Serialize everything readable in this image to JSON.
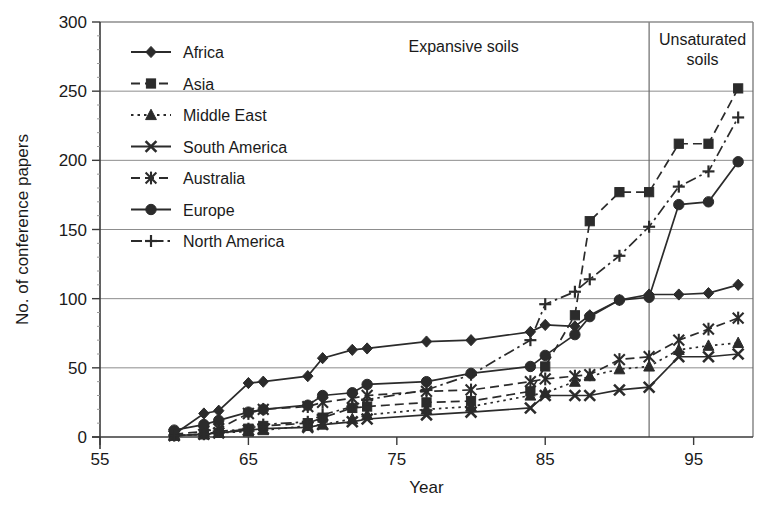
{
  "figure": {
    "background": "#ffffff",
    "ink_color": "#2b2b2b",
    "grid_color": "#8d8d8d"
  },
  "chart_data": {
    "type": "line",
    "title": "",
    "xlabel": "Year",
    "ylabel": "No. of conference papers",
    "xlim": [
      55,
      99
    ],
    "ylim": [
      0,
      300
    ],
    "xticks": [
      55,
      65,
      75,
      85,
      95
    ],
    "yticks": [
      0,
      50,
      100,
      150,
      200,
      250,
      300
    ],
    "grid": "horizontal",
    "legend_position": "top-left",
    "annotations": [
      {
        "text": "Expansive soils",
        "x": 79.5,
        "y": 288
      },
      {
        "text": "Unsaturated soils",
        "x": 94.5,
        "y": 288
      }
    ],
    "dividers": [
      {
        "x": 92
      }
    ],
    "series": [
      {
        "name": "Africa",
        "marker": "diamond",
        "dash": "solid",
        "x": [
          60,
          62,
          63,
          65,
          66,
          69,
          70,
          72,
          73,
          77,
          80,
          84,
          85,
          87,
          88,
          90,
          92,
          94,
          96,
          98
        ],
        "y": [
          2,
          17,
          19,
          39,
          40,
          44,
          57,
          63,
          64,
          69,
          70,
          76,
          81,
          80,
          88,
          99,
          103,
          103,
          104,
          110
        ]
      },
      {
        "name": "Asia",
        "marker": "square",
        "dash": "dashed",
        "x": [
          60,
          62,
          63,
          65,
          66,
          69,
          70,
          72,
          73,
          77,
          80,
          84,
          85,
          87,
          88,
          90,
          92,
          94,
          96,
          98
        ],
        "y": [
          1,
          2,
          3,
          6,
          8,
          10,
          14,
          21,
          22,
          25,
          26,
          33,
          51,
          88,
          156,
          177,
          177,
          212,
          212,
          252
        ]
      },
      {
        "name": "Middle East",
        "marker": "triangle",
        "dash": "dotted",
        "x": [
          60,
          62,
          63,
          65,
          66,
          69,
          70,
          72,
          73,
          77,
          80,
          84,
          85,
          87,
          88,
          90,
          92,
          94,
          96,
          98
        ],
        "y": [
          1,
          2,
          3,
          4,
          5,
          8,
          9,
          13,
          16,
          20,
          22,
          30,
          32,
          40,
          44,
          49,
          51,
          63,
          66,
          68
        ]
      },
      {
        "name": "South America",
        "marker": "x-bold",
        "dash": "solid",
        "x": [
          60,
          62,
          63,
          65,
          66,
          69,
          70,
          72,
          73,
          77,
          80,
          84,
          85,
          87,
          88,
          90,
          92,
          94,
          96,
          98
        ],
        "y": [
          1,
          2,
          3,
          5,
          6,
          7,
          9,
          11,
          13,
          16,
          18,
          21,
          30,
          30,
          30,
          34,
          36,
          58,
          58,
          60
        ]
      },
      {
        "name": "Australia",
        "marker": "asterisk",
        "dash": "dashed",
        "x": [
          60,
          62,
          63,
          65,
          66,
          69,
          70,
          72,
          73,
          77,
          80,
          84,
          85,
          87,
          88,
          90,
          92,
          94,
          96,
          98
        ],
        "y": [
          2,
          4,
          6,
          17,
          20,
          22,
          25,
          28,
          30,
          33,
          34,
          40,
          42,
          44,
          45,
          56,
          58,
          70,
          78,
          86
        ]
      },
      {
        "name": "Europe",
        "marker": "circle",
        "dash": "solid",
        "x": [
          60,
          62,
          63,
          65,
          66,
          69,
          70,
          72,
          73,
          77,
          80,
          84,
          85,
          87,
          88,
          90,
          92,
          94,
          96,
          98
        ],
        "y": [
          5,
          9,
          12,
          18,
          20,
          23,
          30,
          32,
          38,
          40,
          46,
          51,
          59,
          74,
          87,
          99,
          101,
          168,
          170,
          199
        ]
      },
      {
        "name": "North America",
        "marker": "plus",
        "dash": "dashdot",
        "x": [
          60,
          62,
          63,
          65,
          66,
          69,
          70,
          72,
          73,
          77,
          80,
          84,
          85,
          87,
          88,
          90,
          92,
          94,
          96,
          98
        ],
        "y": [
          1,
          2,
          4,
          6,
          9,
          11,
          16,
          22,
          27,
          34,
          45,
          70,
          96,
          105,
          114,
          131,
          152,
          181,
          192,
          231
        ]
      }
    ]
  },
  "legend": {
    "items": [
      {
        "label": "Africa",
        "marker": "diamond",
        "dash": "solid"
      },
      {
        "label": "Asia",
        "marker": "square",
        "dash": "dashed"
      },
      {
        "label": "Middle East",
        "marker": "triangle",
        "dash": "dotted"
      },
      {
        "label": "South America",
        "marker": "x-bold",
        "dash": "solid"
      },
      {
        "label": "Australia",
        "marker": "asterisk",
        "dash": "dashed"
      },
      {
        "label": "Europe",
        "marker": "circle",
        "dash": "solid"
      },
      {
        "label": "North America",
        "marker": "plus",
        "dash": "dashdot"
      }
    ]
  },
  "axes": {
    "x_title": "Year",
    "y_title": "No. of conference papers",
    "x_tick_labels": [
      "55",
      "65",
      "75",
      "85",
      "95"
    ],
    "y_tick_labels": [
      "0",
      "50",
      "100",
      "150",
      "200",
      "250",
      "300"
    ]
  },
  "annotations": {
    "expansive": "Expansive soils",
    "unsaturated_line1": "Unsaturated",
    "unsaturated_line2": "soils"
  }
}
